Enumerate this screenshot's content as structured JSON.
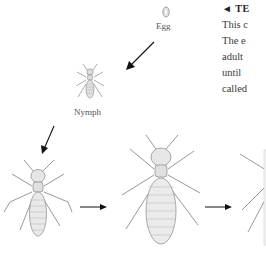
{
  "figure": {
    "stages": [
      {
        "id": "egg",
        "label": "Egg"
      },
      {
        "id": "nymph",
        "label": "Nymph"
      },
      {
        "id": "worker",
        "label": ""
      },
      {
        "id": "reproductive",
        "label": ""
      },
      {
        "id": "winged",
        "label": ""
      }
    ]
  },
  "caption": {
    "lines": [
      "◄ TE",
      "This c",
      "The e",
      "adult",
      "until",
      "called"
    ]
  }
}
